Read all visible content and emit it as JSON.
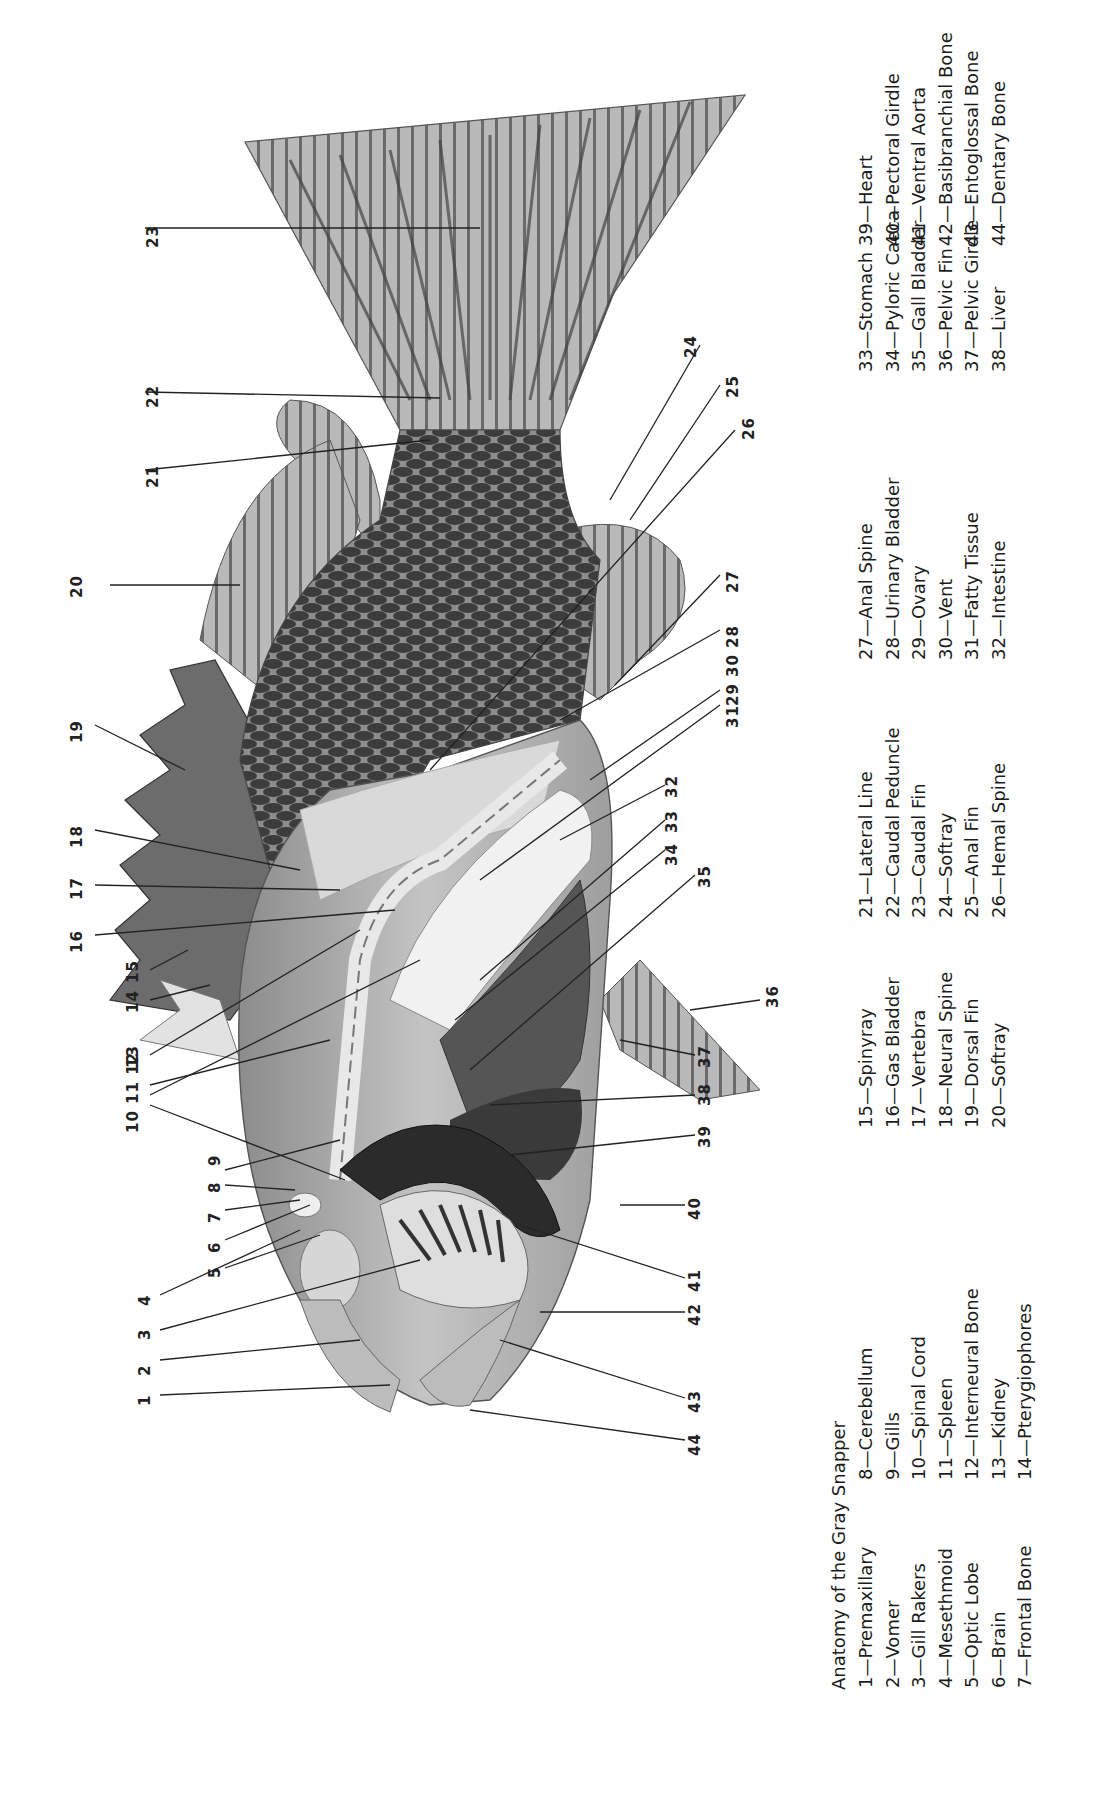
{
  "title": "Anatomy of the Gray Snapper",
  "legend": [
    {
      "n": "1",
      "label": "Premaxillary"
    },
    {
      "n": "2",
      "label": "Vomer"
    },
    {
      "n": "3",
      "label": "Gill Rakers"
    },
    {
      "n": "4",
      "label": "Mesethmoid"
    },
    {
      "n": "5",
      "label": "Optic Lobe"
    },
    {
      "n": "6",
      "label": "Brain"
    },
    {
      "n": "7",
      "label": "Frontal Bone"
    },
    {
      "n": "8",
      "label": "Cerebellum"
    },
    {
      "n": "9",
      "label": "Gills"
    },
    {
      "n": "10",
      "label": "Spinal Cord"
    },
    {
      "n": "11",
      "label": "Spleen"
    },
    {
      "n": "12",
      "label": "Interneural Bone"
    },
    {
      "n": "13",
      "label": "Kidney"
    },
    {
      "n": "14",
      "label": "Pterygiophores"
    },
    {
      "n": "15",
      "label": "Spinyray"
    },
    {
      "n": "16",
      "label": "Gas Bladder"
    },
    {
      "n": "17",
      "label": "Vertebra"
    },
    {
      "n": "18",
      "label": "Neural Spine"
    },
    {
      "n": "19",
      "label": "Dorsal Fin"
    },
    {
      "n": "20",
      "label": "Softray"
    },
    {
      "n": "21",
      "label": "Lateral Line"
    },
    {
      "n": "22",
      "label": "Caudal Peduncle"
    },
    {
      "n": "23",
      "label": "Caudal Fin"
    },
    {
      "n": "24",
      "label": "Softray"
    },
    {
      "n": "25",
      "label": "Anal Fin"
    },
    {
      "n": "26",
      "label": "Hemal Spine"
    },
    {
      "n": "27",
      "label": "Anal Spine"
    },
    {
      "n": "28",
      "label": "Urinary Bladder"
    },
    {
      "n": "29",
      "label": "Ovary"
    },
    {
      "n": "30",
      "label": "Vent"
    },
    {
      "n": "31",
      "label": "Fatty Tissue"
    },
    {
      "n": "32",
      "label": "Intestine"
    },
    {
      "n": "33",
      "label": "Stomach"
    },
    {
      "n": "34",
      "label": "Pyloric Caeca"
    },
    {
      "n": "35",
      "label": "Gall Bladder"
    },
    {
      "n": "36",
      "label": "Pelvic Fin"
    },
    {
      "n": "37",
      "label": "Pelvic Girdle"
    },
    {
      "n": "38",
      "label": "Liver"
    },
    {
      "n": "39",
      "label": "Heart"
    },
    {
      "n": "40",
      "label": "Pectoral Girdle"
    },
    {
      "n": "41",
      "label": "Ventral Aorta"
    },
    {
      "n": "42",
      "label": "Basibranchial Bone"
    },
    {
      "n": "43",
      "label": "Entoglossal Bone"
    },
    {
      "n": "44",
      "label": "Dentary Bone"
    }
  ],
  "dash": "—",
  "callouts": [
    {
      "n": "1",
      "x": 140,
      "y": 1398
    },
    {
      "n": "2",
      "x": 140,
      "y": 1368
    },
    {
      "n": "3",
      "x": 140,
      "y": 1332
    },
    {
      "n": "4",
      "x": 140,
      "y": 1298
    },
    {
      "n": "5",
      "x": 210,
      "y": 1270
    },
    {
      "n": "6",
      "x": 210,
      "y": 1245
    },
    {
      "n": "7",
      "x": 210,
      "y": 1215
    },
    {
      "n": "8",
      "x": 210,
      "y": 1185
    },
    {
      "n": "9",
      "x": 210,
      "y": 1158
    },
    {
      "n": "10 11 12",
      "x": 128,
      "y": 1125
    },
    {
      "n": "13",
      "x": 128,
      "y": 1060
    },
    {
      "n": "14",
      "x": 128,
      "y": 1005
    },
    {
      "n": "15",
      "x": 128,
      "y": 975
    },
    {
      "n": "16",
      "x": 72,
      "y": 945
    },
    {
      "n": "17",
      "x": 72,
      "y": 892
    },
    {
      "n": "18",
      "x": 72,
      "y": 840
    },
    {
      "n": "19",
      "x": 72,
      "y": 735
    },
    {
      "n": "20",
      "x": 72,
      "y": 590
    },
    {
      "n": "21",
      "x": 148,
      "y": 480
    },
    {
      "n": "22",
      "x": 148,
      "y": 400
    },
    {
      "n": "23",
      "x": 148,
      "y": 240
    },
    {
      "n": "24",
      "x": 686,
      "y": 350
    },
    {
      "n": "25",
      "x": 728,
      "y": 390
    },
    {
      "n": "26",
      "x": 744,
      "y": 432
    },
    {
      "n": "27",
      "x": 728,
      "y": 585
    },
    {
      "n": "28",
      "x": 728,
      "y": 640
    },
    {
      "n": "29 30",
      "x": 728,
      "y": 698
    },
    {
      "n": "31",
      "x": 728,
      "y": 720
    },
    {
      "n": "32",
      "x": 667,
      "y": 790
    },
    {
      "n": "33",
      "x": 667,
      "y": 825
    },
    {
      "n": "34",
      "x": 667,
      "y": 858
    },
    {
      "n": "35",
      "x": 700,
      "y": 880
    },
    {
      "n": "36",
      "x": 768,
      "y": 1000
    },
    {
      "n": "37",
      "x": 700,
      "y": 1060
    },
    {
      "n": "38",
      "x": 700,
      "y": 1098
    },
    {
      "n": "39",
      "x": 700,
      "y": 1140
    },
    {
      "n": "40",
      "x": 690,
      "y": 1212
    },
    {
      "n": "41",
      "x": 690,
      "y": 1284
    },
    {
      "n": "42",
      "x": 690,
      "y": 1318
    },
    {
      "n": "43",
      "x": 690,
      "y": 1405
    },
    {
      "n": "44",
      "x": 690,
      "y": 1448
    }
  ],
  "colors": {
    "ink": "#1c1c1c",
    "fish_light": "#cfcfcf",
    "fish_mid": "#9a9a9a",
    "fish_dark": "#3a3a3a",
    "fin": "#b8b8b8",
    "heart": "#2b2b2b"
  }
}
